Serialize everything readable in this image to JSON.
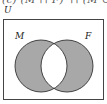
{
  "header": {
    "cutoff_formula": "(c) (M ∩ F)′ ∩ (M ∪ F)"
  },
  "diagram": {
    "type": "venn",
    "universe_label": "U",
    "sets": [
      {
        "label": "M",
        "cx": 41,
        "cy": 66,
        "r": 26
      },
      {
        "label": "F",
        "cx": 67,
        "cy": 66,
        "r": 26
      }
    ],
    "shaded_region": "symmetric difference (M ∪ F minus M ∩ F)",
    "colors": {
      "shade": "#a8a8a8",
      "outline": "#333333",
      "background": "#ffffff",
      "frame": "#444444"
    }
  }
}
